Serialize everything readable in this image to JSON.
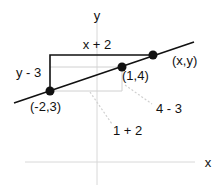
{
  "diagram": {
    "type": "coordinate-geometry",
    "axes": {
      "x_label": "x",
      "y_label": "y",
      "color": "#d8d8d8"
    },
    "line": {
      "color": "#111111"
    },
    "points": [
      {
        "label": "(-2,3)",
        "x": -2,
        "y": 3
      },
      {
        "label": "(1,4)",
        "x": 1,
        "y": 4
      },
      {
        "label": "(x,y)",
        "x": "x",
        "y": "y"
      }
    ],
    "large_triangle": {
      "run_label": "x + 2",
      "rise_label": "y - 3",
      "color": "#111111"
    },
    "small_triangle": {
      "run_label": "1 + 2",
      "rise_label": "4 - 3",
      "color": "#d0d0d0"
    }
  }
}
